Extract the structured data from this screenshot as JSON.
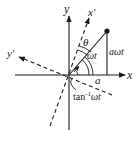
{
  "diagram": {
    "type": "rotating-coordinate-frame",
    "labels": {
      "y_axis": "y",
      "x_axis": "x",
      "x_prime_axis": "x′",
      "y_prime_axis": "y′",
      "theta": "θ",
      "omega_t": "ωt",
      "a_omega_t": "aωt",
      "a": "a",
      "tan_prefix": "tan",
      "tan_sup": "-1",
      "tan_suffix": "ωt"
    },
    "colors": {
      "ink": "#1a1a1a",
      "background": "#ffffff"
    }
  }
}
